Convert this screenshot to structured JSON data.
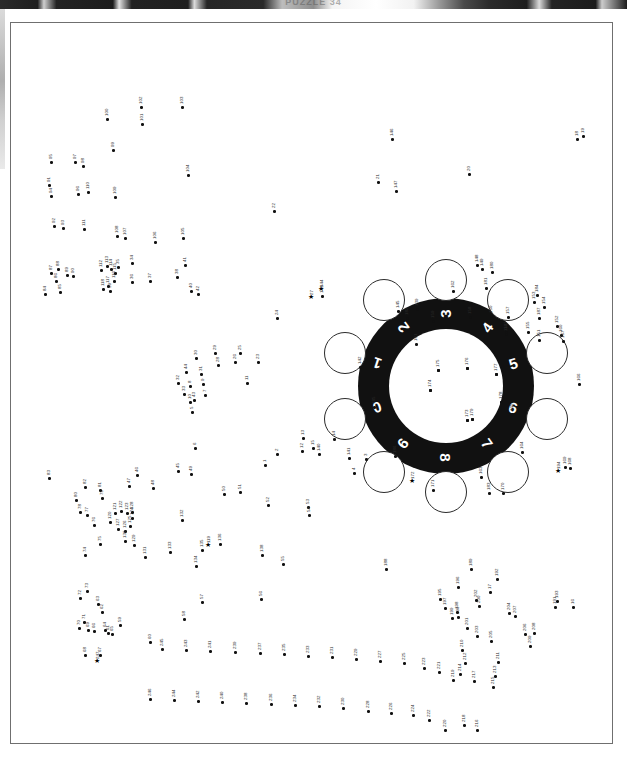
{
  "page": {
    "kind": "dot-to-dot-puzzle-page",
    "header_title": "PUZZLE 34",
    "total_dots": 247,
    "border_color": "#6f6f6f",
    "ink_color": "#111111",
    "paper_color": "#ffffff"
  },
  "dial": {
    "name": "rotary-dial",
    "ring_color": "#111111",
    "digit_color": "#ffffff",
    "digits": [
      "1",
      "2",
      "3",
      "4",
      "5",
      "6",
      "7",
      "8",
      "9",
      "0"
    ],
    "digit_angles_deg": [
      -72,
      -36,
      0,
      36,
      72,
      108,
      144,
      180,
      216,
      252
    ],
    "finger_hole_count": 10,
    "inner_dot_labels": [
      "173",
      "174",
      "175",
      "176",
      "177",
      "178",
      "179"
    ],
    "center_star_label": "179"
  },
  "markers": {
    "star_symbol": "★",
    "star_labels": [
      "27",
      "119",
      "144",
      "172",
      "194",
      "247"
    ]
  },
  "chart_data": {
    "type": "scatter",
    "title": "PUZZLE 34",
    "xlabel": "",
    "ylabel": "",
    "grid": false,
    "legend": "none",
    "xlim": [
      0,
      603
    ],
    "ylim": [
      0,
      722
    ],
    "note": "Connect-the-dots coordinates in page pixels; label = sequence number.",
    "points": [
      {
        "n": "1",
        "x": 253,
        "y": 441
      },
      {
        "n": "2",
        "x": 265,
        "y": 430
      },
      {
        "n": "3",
        "x": 354,
        "y": 435
      },
      {
        "n": "4",
        "x": 342,
        "y": 449
      },
      {
        "n": "5",
        "x": 180,
        "y": 388
      },
      {
        "n": "6",
        "x": 183,
        "y": 424
      },
      {
        "n": "7",
        "x": 193,
        "y": 371
      },
      {
        "n": "8",
        "x": 178,
        "y": 362
      },
      {
        "n": "9",
        "x": 191,
        "y": 360
      },
      {
        "n": "10",
        "x": 178,
        "y": 378
      },
      {
        "n": "11",
        "x": 235,
        "y": 359
      },
      {
        "n": "12",
        "x": 290,
        "y": 427
      },
      {
        "n": "13",
        "x": 291,
        "y": 414
      },
      {
        "n": "14",
        "x": 322,
        "y": 415
      },
      {
        "n": "15",
        "x": 301,
        "y": 424
      },
      {
        "n": "16",
        "x": 561,
        "y": 583
      },
      {
        "n": "17",
        "x": 478,
        "y": 568
      },
      {
        "n": "18",
        "x": 565,
        "y": 115
      },
      {
        "n": "19",
        "x": 571,
        "y": 112
      },
      {
        "n": "20",
        "x": 457,
        "y": 150
      },
      {
        "n": "21",
        "x": 366,
        "y": 158
      },
      {
        "n": "22",
        "x": 262,
        "y": 187
      },
      {
        "n": "23",
        "x": 246,
        "y": 338
      },
      {
        "n": "24",
        "x": 265,
        "y": 294
      },
      {
        "n": "25",
        "x": 228,
        "y": 329
      },
      {
        "n": "26",
        "x": 223,
        "y": 338
      },
      {
        "n": "27",
        "x": 300,
        "y": 274
      },
      {
        "n": "28",
        "x": 206,
        "y": 341
      },
      {
        "n": "29",
        "x": 203,
        "y": 329
      },
      {
        "n": "30",
        "x": 184,
        "y": 334
      },
      {
        "n": "31",
        "x": 189,
        "y": 350
      },
      {
        "n": "32",
        "x": 166,
        "y": 359
      },
      {
        "n": "33",
        "x": 172,
        "y": 370
      },
      {
        "n": "34",
        "x": 120,
        "y": 239
      },
      {
        "n": "35",
        "x": 106,
        "y": 243
      },
      {
        "n": "36",
        "x": 120,
        "y": 258
      },
      {
        "n": "37",
        "x": 138,
        "y": 257
      },
      {
        "n": "38",
        "x": 165,
        "y": 253
      },
      {
        "n": "39",
        "x": 98,
        "y": 267
      },
      {
        "n": "40",
        "x": 179,
        "y": 267
      },
      {
        "n": "41",
        "x": 173,
        "y": 241
      },
      {
        "n": "42",
        "x": 186,
        "y": 270
      },
      {
        "n": "43",
        "x": 182,
        "y": 376
      },
      {
        "n": "44",
        "x": 174,
        "y": 348
      },
      {
        "n": "45",
        "x": 166,
        "y": 447
      },
      {
        "n": "46",
        "x": 125,
        "y": 451
      },
      {
        "n": "47",
        "x": 117,
        "y": 462
      },
      {
        "n": "48",
        "x": 141,
        "y": 464
      },
      {
        "n": "49",
        "x": 179,
        "y": 450
      },
      {
        "n": "50",
        "x": 212,
        "y": 470
      },
      {
        "n": "51",
        "x": 228,
        "y": 468
      },
      {
        "n": "52",
        "x": 256,
        "y": 481
      },
      {
        "n": "53",
        "x": 296,
        "y": 483
      },
      {
        "n": "54",
        "x": 297,
        "y": 491
      },
      {
        "n": "55",
        "x": 271,
        "y": 540
      },
      {
        "n": "56",
        "x": 249,
        "y": 575
      },
      {
        "n": "57",
        "x": 190,
        "y": 578
      },
      {
        "n": "58",
        "x": 172,
        "y": 595
      },
      {
        "n": "59",
        "x": 108,
        "y": 601
      },
      {
        "n": "60",
        "x": 138,
        "y": 618
      },
      {
        "n": "61",
        "x": 96,
        "y": 609
      },
      {
        "n": "62",
        "x": 90,
        "y": 588
      },
      {
        "n": "63",
        "x": 86,
        "y": 580
      },
      {
        "n": "64",
        "x": 93,
        "y": 606
      },
      {
        "n": "65",
        "x": 100,
        "y": 610
      },
      {
        "n": "66",
        "x": 82,
        "y": 607
      },
      {
        "n": "67",
        "x": 88,
        "y": 631
      },
      {
        "n": "68",
        "x": 73,
        "y": 631
      },
      {
        "n": "69",
        "x": 76,
        "y": 606
      },
      {
        "n": "70",
        "x": 67,
        "y": 604
      },
      {
        "n": "71",
        "x": 72,
        "y": 598
      },
      {
        "n": "72",
        "x": 68,
        "y": 574
      },
      {
        "n": "73",
        "x": 75,
        "y": 567
      },
      {
        "n": "74",
        "x": 73,
        "y": 531
      },
      {
        "n": "75",
        "x": 88,
        "y": 520
      },
      {
        "n": "76",
        "x": 82,
        "y": 501
      },
      {
        "n": "77",
        "x": 75,
        "y": 491
      },
      {
        "n": "78",
        "x": 68,
        "y": 488
      },
      {
        "n": "79",
        "x": 90,
        "y": 474
      },
      {
        "n": "80",
        "x": 64,
        "y": 476
      },
      {
        "n": "81",
        "x": 88,
        "y": 466
      },
      {
        "n": "82",
        "x": 73,
        "y": 463
      },
      {
        "n": "83",
        "x": 37,
        "y": 454
      },
      {
        "n": "84",
        "x": 33,
        "y": 270
      },
      {
        "n": "85",
        "x": 48,
        "y": 268
      },
      {
        "n": "86",
        "x": 44,
        "y": 257
      },
      {
        "n": "87",
        "x": 39,
        "y": 249
      },
      {
        "n": "88",
        "x": 46,
        "y": 245
      },
      {
        "n": "89",
        "x": 55,
        "y": 251
      },
      {
        "n": "90",
        "x": 61,
        "y": 252
      },
      {
        "n": "91",
        "x": 37,
        "y": 161
      },
      {
        "n": "92",
        "x": 42,
        "y": 202
      },
      {
        "n": "93",
        "x": 51,
        "y": 204
      },
      {
        "n": "94",
        "x": 39,
        "y": 172
      },
      {
        "n": "95",
        "x": 39,
        "y": 138
      },
      {
        "n": "96",
        "x": 66,
        "y": 170
      },
      {
        "n": "97",
        "x": 63,
        "y": 138
      },
      {
        "n": "98",
        "x": 71,
        "y": 142
      },
      {
        "n": "99",
        "x": 101,
        "y": 126
      },
      {
        "n": "100",
        "x": 95,
        "y": 95
      },
      {
        "n": "101",
        "x": 130,
        "y": 100
      },
      {
        "n": "102",
        "x": 129,
        "y": 83
      },
      {
        "n": "103",
        "x": 170,
        "y": 83
      },
      {
        "n": "104",
        "x": 176,
        "y": 151
      },
      {
        "n": "105",
        "x": 171,
        "y": 214
      },
      {
        "n": "106",
        "x": 143,
        "y": 218
      },
      {
        "n": "107",
        "x": 113,
        "y": 214
      },
      {
        "n": "108",
        "x": 105,
        "y": 212
      },
      {
        "n": "109",
        "x": 103,
        "y": 173
      },
      {
        "n": "110",
        "x": 76,
        "y": 168
      },
      {
        "n": "111",
        "x": 72,
        "y": 205
      },
      {
        "n": "112",
        "x": 89,
        "y": 246
      },
      {
        "n": "113",
        "x": 95,
        "y": 242
      },
      {
        "n": "114",
        "x": 99,
        "y": 245
      },
      {
        "n": "115",
        "x": 103,
        "y": 249
      },
      {
        "n": "116",
        "x": 102,
        "y": 257
      },
      {
        "n": "117",
        "x": 96,
        "y": 262
      },
      {
        "n": "118",
        "x": 91,
        "y": 265
      },
      {
        "n": "119",
        "x": 197,
        "y": 522
      },
      {
        "n": "120",
        "x": 98,
        "y": 498
      },
      {
        "n": "121",
        "x": 103,
        "y": 489
      },
      {
        "n": "122",
        "x": 109,
        "y": 487
      },
      {
        "n": "123",
        "x": 115,
        "y": 489
      },
      {
        "n": "124",
        "x": 120,
        "y": 494
      },
      {
        "n": "125",
        "x": 118,
        "y": 502
      },
      {
        "n": "126",
        "x": 113,
        "y": 507
      },
      {
        "n": "127",
        "x": 106,
        "y": 505
      },
      {
        "n": "128",
        "x": 120,
        "y": 488
      },
      {
        "n": "129",
        "x": 122,
        "y": 521
      },
      {
        "n": "130",
        "x": 113,
        "y": 517
      },
      {
        "n": "131",
        "x": 133,
        "y": 533
      },
      {
        "n": "132",
        "x": 170,
        "y": 496
      },
      {
        "n": "133",
        "x": 158,
        "y": 528
      },
      {
        "n": "134",
        "x": 184,
        "y": 542
      },
      {
        "n": "135",
        "x": 190,
        "y": 526
      },
      {
        "n": "136",
        "x": 208,
        "y": 520
      },
      {
        "n": "137",
        "x": 494,
        "y": 308
      },
      {
        "n": "138",
        "x": 250,
        "y": 531
      },
      {
        "n": "139",
        "x": 405,
        "y": 285
      },
      {
        "n": "140",
        "x": 307,
        "y": 430
      },
      {
        "n": "141",
        "x": 337,
        "y": 434
      },
      {
        "n": "142",
        "x": 348,
        "y": 343
      },
      {
        "n": "143",
        "x": 310,
        "y": 272
      },
      {
        "n": "144",
        "x": 310,
        "y": 266
      },
      {
        "n": "145",
        "x": 386,
        "y": 287
      },
      {
        "n": "146",
        "x": 380,
        "y": 115
      },
      {
        "n": "147",
        "x": 384,
        "y": 167
      },
      {
        "n": "148",
        "x": 465,
        "y": 241
      },
      {
        "n": "149",
        "x": 470,
        "y": 245
      },
      {
        "n": "150",
        "x": 479,
        "y": 292
      },
      {
        "n": "151",
        "x": 527,
        "y": 316
      },
      {
        "n": "152",
        "x": 545,
        "y": 302
      },
      {
        "n": "153",
        "x": 522,
        "y": 278
      },
      {
        "n": "154",
        "x": 532,
        "y": 283
      },
      {
        "n": "155",
        "x": 516,
        "y": 308
      },
      {
        "n": "156",
        "x": 494,
        "y": 310
      },
      {
        "n": "157",
        "x": 496,
        "y": 293
      },
      {
        "n": "158",
        "x": 458,
        "y": 293
      },
      {
        "n": "159",
        "x": 421,
        "y": 297
      },
      {
        "n": "160",
        "x": 549,
        "y": 311
      },
      {
        "n": "161",
        "x": 404,
        "y": 320
      },
      {
        "n": "162",
        "x": 441,
        "y": 267
      },
      {
        "n": "163",
        "x": 469,
        "y": 453
      },
      {
        "n": "164",
        "x": 510,
        "y": 428
      },
      {
        "n": "165",
        "x": 500,
        "y": 390
      },
      {
        "n": "166",
        "x": 567,
        "y": 360
      },
      {
        "n": "167",
        "x": 551,
        "y": 317
      },
      {
        "n": "168",
        "x": 558,
        "y": 444
      },
      {
        "n": "169",
        "x": 553,
        "y": 443
      },
      {
        "n": "170",
        "x": 491,
        "y": 469
      },
      {
        "n": "171",
        "x": 421,
        "y": 466
      },
      {
        "n": "172",
        "x": 401,
        "y": 458
      },
      {
        "n": "173",
        "x": 455,
        "y": 396
      },
      {
        "n": "174",
        "x": 418,
        "y": 366
      },
      {
        "n": "175",
        "x": 426,
        "y": 346
      },
      {
        "n": "176",
        "x": 455,
        "y": 344
      },
      {
        "n": "177",
        "x": 484,
        "y": 350
      },
      {
        "n": "178",
        "x": 489,
        "y": 378
      },
      {
        "n": "179",
        "x": 460,
        "y": 395
      },
      {
        "n": "180",
        "x": 480,
        "y": 248
      },
      {
        "n": "181",
        "x": 474,
        "y": 264
      },
      {
        "n": "182",
        "x": 395,
        "y": 294
      },
      {
        "n": "183",
        "x": 477,
        "y": 469
      },
      {
        "n": "184",
        "x": 525,
        "y": 271
      },
      {
        "n": "185",
        "x": 362,
        "y": 383
      },
      {
        "n": "186",
        "x": 383,
        "y": 432
      },
      {
        "n": "187",
        "x": 527,
        "y": 294
      },
      {
        "n": "188",
        "x": 374,
        "y": 545
      },
      {
        "n": "189",
        "x": 459,
        "y": 545
      },
      {
        "n": "190",
        "x": 446,
        "y": 593
      },
      {
        "n": "191",
        "x": 543,
        "y": 583
      },
      {
        "n": "192",
        "x": 485,
        "y": 555
      },
      {
        "n": "193",
        "x": 545,
        "y": 577
      },
      {
        "n": "194",
        "x": 547,
        "y": 448
      },
      {
        "n": "195",
        "x": 428,
        "y": 575
      },
      {
        "n": "196",
        "x": 446,
        "y": 563
      },
      {
        "n": "197",
        "x": 433,
        "y": 584
      },
      {
        "n": "198",
        "x": 445,
        "y": 588
      },
      {
        "n": "199",
        "x": 440,
        "y": 594
      },
      {
        "n": "200",
        "x": 467,
        "y": 582
      },
      {
        "n": "201",
        "x": 455,
        "y": 604
      },
      {
        "n": "202",
        "x": 464,
        "y": 576
      },
      {
        "n": "203",
        "x": 465,
        "y": 612
      },
      {
        "n": "204",
        "x": 497,
        "y": 589
      },
      {
        "n": "205",
        "x": 479,
        "y": 617
      },
      {
        "n": "206",
        "x": 513,
        "y": 610
      },
      {
        "n": "207",
        "x": 503,
        "y": 592
      },
      {
        "n": "208",
        "x": 522,
        "y": 609
      },
      {
        "n": "209",
        "x": 518,
        "y": 622
      },
      {
        "n": "210",
        "x": 450,
        "y": 626
      },
      {
        "n": "211",
        "x": 486,
        "y": 638
      },
      {
        "n": "212",
        "x": 453,
        "y": 639
      },
      {
        "n": "213",
        "x": 483,
        "y": 652
      },
      {
        "n": "214",
        "x": 448,
        "y": 650
      },
      {
        "n": "215",
        "x": 481,
        "y": 663
      },
      {
        "n": "216",
        "x": 465,
        "y": 706
      },
      {
        "n": "217",
        "x": 462,
        "y": 657
      },
      {
        "n": "218",
        "x": 452,
        "y": 701
      },
      {
        "n": "219",
        "x": 441,
        "y": 656
      },
      {
        "n": "220",
        "x": 433,
        "y": 706
      },
      {
        "n": "221",
        "x": 427,
        "y": 648
      },
      {
        "n": "222",
        "x": 417,
        "y": 696
      },
      {
        "n": "223",
        "x": 412,
        "y": 644
      },
      {
        "n": "224",
        "x": 401,
        "y": 691
      },
      {
        "n": "225",
        "x": 392,
        "y": 639
      },
      {
        "n": "226",
        "x": 379,
        "y": 689
      },
      {
        "n": "227",
        "x": 368,
        "y": 637
      },
      {
        "n": "228",
        "x": 356,
        "y": 687
      },
      {
        "n": "229",
        "x": 344,
        "y": 635
      },
      {
        "n": "230",
        "x": 331,
        "y": 684
      },
      {
        "n": "231",
        "x": 320,
        "y": 633
      },
      {
        "n": "232",
        "x": 307,
        "y": 682
      },
      {
        "n": "233",
        "x": 296,
        "y": 632
      },
      {
        "n": "234",
        "x": 283,
        "y": 681
      },
      {
        "n": "235",
        "x": 272,
        "y": 630
      },
      {
        "n": "236",
        "x": 259,
        "y": 680
      },
      {
        "n": "237",
        "x": 248,
        "y": 629
      },
      {
        "n": "238",
        "x": 234,
        "y": 679
      },
      {
        "n": "239",
        "x": 223,
        "y": 628
      },
      {
        "n": "240",
        "x": 210,
        "y": 678
      },
      {
        "n": "241",
        "x": 198,
        "y": 627
      },
      {
        "n": "242",
        "x": 186,
        "y": 677
      },
      {
        "n": "243",
        "x": 174,
        "y": 626
      },
      {
        "n": "244",
        "x": 162,
        "y": 676
      },
      {
        "n": "245",
        "x": 150,
        "y": 625
      },
      {
        "n": "246",
        "x": 138,
        "y": 675
      },
      {
        "n": "247",
        "x": 86,
        "y": 638
      }
    ]
  }
}
